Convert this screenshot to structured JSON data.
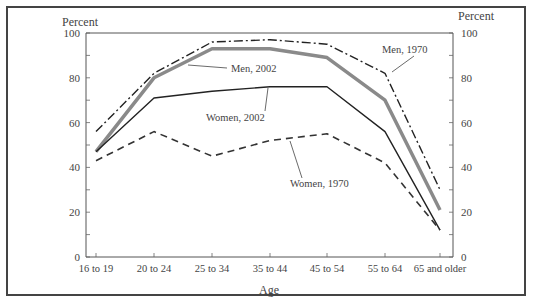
{
  "chart_data": {
    "type": "line",
    "title": "",
    "xlabel": "Age",
    "ylabel_left": "Percent",
    "ylabel_right": "Percent",
    "ylim": [
      0,
      100
    ],
    "yticks": [
      0,
      20,
      40,
      60,
      80,
      100
    ],
    "categories": [
      "16 to 19",
      "20 to 24",
      "25 to 34",
      "35 to 44",
      "45 to 54",
      "55 to 64",
      "65 and older"
    ],
    "series": [
      {
        "name": "Men, 1970",
        "style": "dash-dot",
        "color": "#222222",
        "values": [
          56,
          82,
          96,
          97,
          95,
          82,
          30
        ]
      },
      {
        "name": "Men, 2002",
        "style": "thick-gray",
        "color": "#888888",
        "values": [
          47,
          80,
          93,
          93,
          89,
          70,
          21
        ]
      },
      {
        "name": "Women, 2002",
        "style": "solid",
        "color": "#222222",
        "values": [
          47,
          71,
          74,
          76,
          76,
          56,
          12
        ]
      },
      {
        "name": "Women, 1970",
        "style": "dashed",
        "color": "#333333",
        "values": [
          43,
          56,
          45,
          52,
          55,
          42,
          12
        ]
      }
    ],
    "grid": false,
    "legend_position": "inline labels with leader lines"
  },
  "labels": {
    "percent_left": "Percent",
    "percent_right": "Percent",
    "age": "Age",
    "men_1970": "Men, 1970",
    "men_2002": "Men, 2002",
    "women_2002": "Women, 2002",
    "women_1970": "Women, 1970"
  }
}
